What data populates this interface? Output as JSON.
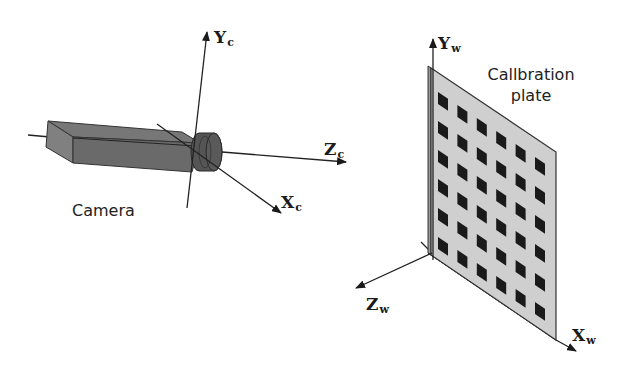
{
  "figure": {
    "camera_label": "Camera",
    "plate_label_line1": "Callbration",
    "plate_label_line2": "plate",
    "camera_axes": {
      "y": {
        "main": "Y",
        "sub": "c"
      },
      "z": {
        "main": "Z",
        "sub": "c"
      },
      "x": {
        "main": "X",
        "sub": "c"
      }
    },
    "world_axes": {
      "y": {
        "main": "Y",
        "sub": "w"
      },
      "z": {
        "main": "Z",
        "sub": "w"
      },
      "x": {
        "main": "X",
        "sub": "w"
      }
    },
    "plate_grid": {
      "rows": 6,
      "columns": 6
    },
    "colors": {
      "ink": "#222222",
      "camera_fill": "#6a6a6a",
      "plate_fill": "#cfcfcf",
      "target_fill": "#1a1a1a"
    }
  }
}
